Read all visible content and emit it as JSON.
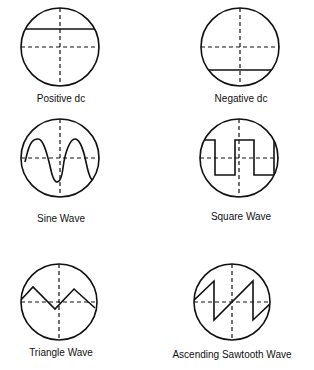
{
  "diagrams": [
    {
      "label": "Positive dc",
      "type": "positive-dc"
    },
    {
      "label": "Negative dc",
      "type": "negative-dc"
    },
    {
      "label": "Sine Wave",
      "type": "sine"
    },
    {
      "label": "Square Wave",
      "type": "square"
    },
    {
      "label": "Triangle Wave",
      "type": "triangle"
    },
    {
      "label": "Ascending Sawtooth Wave",
      "type": "sawtooth-ascending"
    }
  ],
  "colors": {
    "ink": "#111111",
    "background": "#ffffff"
  }
}
